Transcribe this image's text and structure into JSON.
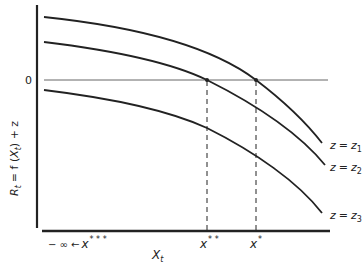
{
  "diagram": {
    "title": "",
    "y_axis_label": "R_t = f(X_t) + z",
    "y_axis_label_parts": {
      "R": "R",
      "t_sub": "t",
      "eq": "= f (",
      "X": "X",
      "t_sub2": "t",
      "tail": ") + z"
    },
    "x_axis_label": "X",
    "x_axis_label_sub": "t",
    "zero_label": "0",
    "curves": [
      {
        "id": "z1",
        "label_lhs": "z",
        "label_eq": "=",
        "label_rhs": "z",
        "label_sub": "1"
      },
      {
        "id": "z2",
        "label_lhs": "z",
        "label_eq": "=",
        "label_rhs": "z",
        "label_sub": "2"
      },
      {
        "id": "z3",
        "label_lhs": "z",
        "label_eq": "=",
        "label_rhs": "z",
        "label_sub": "3"
      }
    ],
    "x_markers": [
      {
        "id": "x_triple_star",
        "prefix": "− ∞ ←",
        "base": "x",
        "sup": "* * *"
      },
      {
        "id": "x_double_star",
        "base": "x",
        "sup": "* *"
      },
      {
        "id": "x_star",
        "base": "x",
        "sup": "*"
      }
    ],
    "colors": {
      "ink": "#222222",
      "background": "#ffffff",
      "zero_line": "#666666"
    }
  }
}
